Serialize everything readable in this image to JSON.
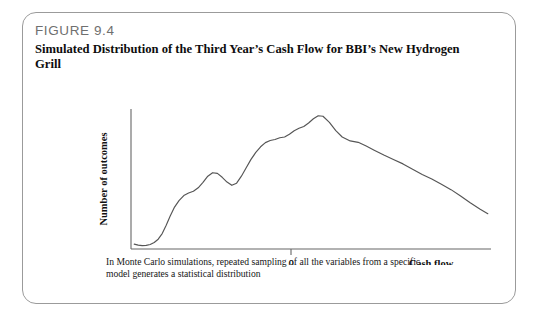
{
  "figure": {
    "number": "FIGURE 9.4",
    "title": "Simulated Distribution of the Third Year’s Cash Flow for BBI’s New Hydrogen Grill",
    "caption": "In Monte Carlo simulations, repeated sampling of all the variables from a specific model generates a statistical distribution"
  },
  "colors": {
    "card_border": "#9b9b9b",
    "figure_number_text": "#6f6f6f",
    "title_text": "#0d0d0d",
    "axis_line": "#666666",
    "curve_line": "#555555",
    "caption_text": "#161616"
  },
  "chart_data": {
    "type": "line",
    "title": "Simulated Distribution of the Third Year’s Cash Flow for BBI’s New Hydrogen Grill",
    "xlabel": "Cash flow",
    "ylabel": "Number of outcomes",
    "grid": false,
    "legend": null,
    "xticks": [
      "0"
    ],
    "xtick_positions": [
      0
    ],
    "yticks": [],
    "xlim": [
      -1.0,
      1.25
    ],
    "ylim": [
      0,
      1.0
    ],
    "annotations": [],
    "series": [
      {
        "name": "Simulated third-year cash flow distribution",
        "x": [
          -0.98,
          -0.955,
          -0.93,
          -0.905,
          -0.88,
          -0.855,
          -0.83,
          -0.805,
          -0.78,
          -0.755,
          -0.73,
          -0.7,
          -0.67,
          -0.64,
          -0.61,
          -0.58,
          -0.55,
          -0.52,
          -0.49,
          -0.46,
          -0.43,
          -0.4,
          -0.37,
          -0.34,
          -0.31,
          -0.28,
          -0.25,
          -0.22,
          -0.19,
          -0.16,
          -0.13,
          -0.1,
          -0.07,
          -0.04,
          -0.01,
          0.02,
          0.05,
          0.08,
          0.11,
          0.14,
          0.17,
          0.2,
          0.24,
          0.28,
          0.32,
          0.37,
          0.42,
          0.47,
          0.52,
          0.58,
          0.64,
          0.7,
          0.76,
          0.82,
          0.88,
          0.94,
          1.0,
          1.06,
          1.12,
          1.18,
          1.23
        ],
        "y": [
          0.035,
          0.028,
          0.024,
          0.026,
          0.032,
          0.046,
          0.07,
          0.11,
          0.17,
          0.235,
          0.295,
          0.345,
          0.382,
          0.4,
          0.412,
          0.437,
          0.476,
          0.52,
          0.545,
          0.54,
          0.512,
          0.478,
          0.455,
          0.47,
          0.52,
          0.58,
          0.64,
          0.69,
          0.73,
          0.76,
          0.775,
          0.782,
          0.795,
          0.8,
          0.82,
          0.845,
          0.862,
          0.875,
          0.9,
          0.93,
          0.952,
          0.948,
          0.905,
          0.845,
          0.8,
          0.772,
          0.762,
          0.735,
          0.706,
          0.672,
          0.64,
          0.608,
          0.57,
          0.532,
          0.5,
          0.462,
          0.424,
          0.378,
          0.33,
          0.286,
          0.252
        ]
      }
    ]
  }
}
